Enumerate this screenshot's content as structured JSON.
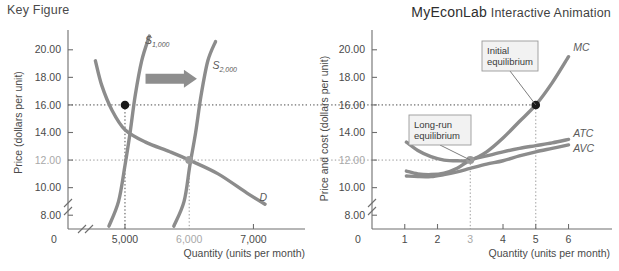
{
  "header": {
    "left_title": "Key Figure",
    "brand": "MyEconLab",
    "brand_sub": "Interactive Animation"
  },
  "chart_data": [
    {
      "id": "market-supply-demand",
      "type": "line",
      "title": "Key Figure",
      "xlabel": "Quantity (units per month)",
      "ylabel": "Price (dollars per unit)",
      "xlim": [
        4300,
        7600
      ],
      "ylim": [
        7.0,
        21.0
      ],
      "grid": false,
      "axis_break": true,
      "xticks": [
        "5,000",
        "6,000",
        "7,000"
      ],
      "xtick_values": [
        5000,
        6000,
        7000
      ],
      "xtick_dim": [
        "6,000"
      ],
      "origin_label": "0",
      "yticks": [
        "8.00",
        "10.00",
        "12.00",
        "14.00",
        "16.00",
        "18.00",
        "20.00"
      ],
      "ytick_values": [
        8,
        10,
        12,
        14,
        16,
        18,
        20
      ],
      "ytick_dim": [
        "12.00"
      ],
      "series": [
        {
          "name": "S 1,000",
          "label": "S",
          "label_sub": "1,000",
          "points": [
            [
              4750,
              7.2
            ],
            [
              4900,
              9.0
            ],
            [
              5000,
              11.6
            ],
            [
              5080,
              14.0
            ],
            [
              5160,
              16.7
            ],
            [
              5260,
              19.2
            ],
            [
              5380,
              21.0
            ]
          ]
        },
        {
          "name": "S 2,000",
          "label": "S",
          "label_sub": "2,000",
          "points": [
            [
              5760,
              7.2
            ],
            [
              5920,
              9.0
            ],
            [
              6010,
              11.6
            ],
            [
              6100,
              14.0
            ],
            [
              6185,
              16.7
            ],
            [
              6290,
              19.2
            ],
            [
              6410,
              20.6
            ]
          ]
        },
        {
          "name": "D",
          "label": "D",
          "label_sub": "",
          "points": [
            [
              4540,
              19.2
            ],
            [
              4640,
              17.4
            ],
            [
              4800,
              15.6
            ],
            [
              5000,
              14.2
            ],
            [
              5320,
              13.3
            ],
            [
              5700,
              12.6
            ],
            [
              6000,
              12.0
            ],
            [
              6450,
              11.0
            ],
            [
              6900,
              9.6
            ],
            [
              7180,
              8.8
            ]
          ]
        }
      ],
      "points_marked": [
        {
          "name": "initial-equilibrium",
          "x": 5000,
          "y": 16.0,
          "color": "#1a1a1a"
        },
        {
          "name": "new-equilibrium",
          "x": 6000,
          "y": 12.0,
          "color": "#9a9a9a"
        }
      ],
      "annotations": [
        {
          "type": "arrow",
          "direction": "right",
          "from_x": 5320,
          "to_x": 6120,
          "y": 17.9
        }
      ]
    },
    {
      "id": "firm-cost-curves",
      "type": "line",
      "title": "MyEconLab Interactive Animation",
      "xlabel": "Quantity (units per month)",
      "ylabel": "Price and cost (dollars per unit)",
      "xlim": [
        0,
        6.9
      ],
      "ylim": [
        7.0,
        21.0
      ],
      "grid": false,
      "axis_break": true,
      "xticks": [
        "1",
        "2",
        "3",
        "4",
        "5",
        "6"
      ],
      "xtick_values": [
        1,
        2,
        3,
        4,
        5,
        6
      ],
      "xtick_dim": [
        "3"
      ],
      "origin_label": "0",
      "yticks": [
        "8.00",
        "10.00",
        "12.00",
        "14.00",
        "16.00",
        "18.00",
        "20.00"
      ],
      "ytick_values": [
        8,
        10,
        12,
        14,
        16,
        18,
        20
      ],
      "ytick_dim": [
        "12.00"
      ],
      "series": [
        {
          "name": "MC",
          "label": "MC",
          "label_sub": "",
          "points": [
            [
              1.05,
              13.3
            ],
            [
              1.4,
              12.7
            ],
            [
              1.8,
              12.25
            ],
            [
              2.2,
              12.0
            ],
            [
              2.6,
              11.95
            ],
            [
              3.0,
              12.0
            ],
            [
              3.5,
              12.6
            ],
            [
              4.0,
              13.6
            ],
            [
              4.5,
              14.8
            ],
            [
              5.0,
              16.0
            ],
            [
              5.5,
              17.6
            ],
            [
              6.0,
              19.5
            ]
          ]
        },
        {
          "name": "ATC",
          "label": "ATC",
          "label_sub": "",
          "points": [
            [
              1.05,
              11.2
            ],
            [
              1.4,
              11.0
            ],
            [
              1.8,
              10.95
            ],
            [
              2.2,
              11.05
            ],
            [
              2.6,
              11.4
            ],
            [
              3.0,
              12.0
            ],
            [
              3.5,
              12.3
            ],
            [
              4.0,
              12.6
            ],
            [
              4.5,
              12.85
            ],
            [
              5.0,
              13.05
            ],
            [
              5.5,
              13.25
            ],
            [
              6.0,
              13.5
            ]
          ]
        },
        {
          "name": "AVC",
          "label": "AVC",
          "label_sub": "",
          "points": [
            [
              1.05,
              10.85
            ],
            [
              1.4,
              10.8
            ],
            [
              1.8,
              10.8
            ],
            [
              2.2,
              10.95
            ],
            [
              2.6,
              11.15
            ],
            [
              3.0,
              11.4
            ],
            [
              3.5,
              11.7
            ],
            [
              4.0,
              11.95
            ],
            [
              4.5,
              12.3
            ],
            [
              5.0,
              12.6
            ],
            [
              5.5,
              12.85
            ],
            [
              6.0,
              13.1
            ]
          ]
        }
      ],
      "points_marked": [
        {
          "name": "initial-equilibrium",
          "x": 5,
          "y": 16.0,
          "color": "#1a1a1a"
        },
        {
          "name": "long-run-equilibrium",
          "x": 3,
          "y": 12.0,
          "color": "#9a9a9a"
        }
      ],
      "callouts": [
        {
          "name": "initial-equilibrium-callout",
          "line1": "Initial",
          "line2": "equilibrium",
          "target_x": 5,
          "target_y": 16.0
        },
        {
          "name": "long-run-equilibrium-callout",
          "line1": "Long-run",
          "line2": "equilibrium",
          "target_x": 3,
          "target_y": 12.0
        }
      ]
    }
  ]
}
